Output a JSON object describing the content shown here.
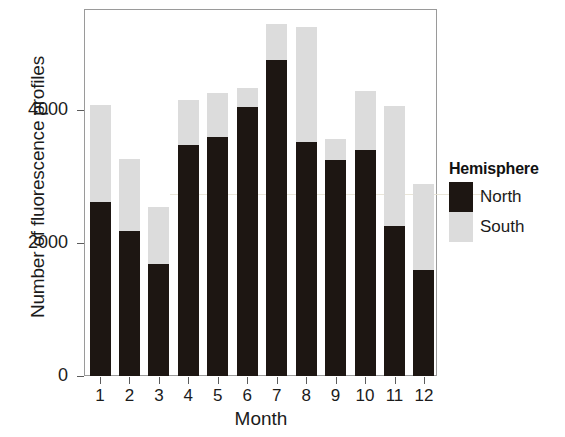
{
  "chart_data": {
    "type": "bar",
    "subtype": "stacked-bar",
    "title": "",
    "xlabel": "Month",
    "ylabel": "Number of fluorescence profiles",
    "categories": [
      "1",
      "2",
      "3",
      "4",
      "5",
      "6",
      "7",
      "8",
      "9",
      "10",
      "11",
      "12"
    ],
    "series": [
      {
        "name": "North",
        "color": "#1d1612",
        "values": [
          2620,
          2180,
          1680,
          3480,
          3600,
          4050,
          4760,
          3520,
          3250,
          3400,
          2250,
          1590
        ]
      },
      {
        "name": "South",
        "color": "#dcdcdc",
        "values": [
          1460,
          1080,
          860,
          670,
          650,
          280,
          530,
          1730,
          310,
          880,
          1810,
          1300
        ]
      }
    ],
    "totals": [
      4080,
      3260,
      2540,
      4150,
      4250,
      4330,
      5290,
      5250,
      3560,
      4280,
      4060,
      2890
    ],
    "ylim": [
      0,
      5520
    ],
    "yticks": [
      0,
      2000,
      4000
    ],
    "ytick_labels": [
      "0",
      "2000",
      "4000"
    ],
    "xtick_labels": [
      "1",
      "2",
      "3",
      "4",
      "5",
      "6",
      "7",
      "8",
      "9",
      "10",
      "11",
      "12"
    ],
    "grid": false,
    "legend": {
      "title": "Hemisphere",
      "position": "right",
      "entries": [
        {
          "label": "North",
          "color": "#1d1612"
        },
        {
          "label": "South",
          "color": "#dcdcdc"
        }
      ]
    }
  },
  "axes": {
    "y_title": "Number of fluorescence profiles",
    "x_title": "Month"
  },
  "legend": {
    "title": "Hemisphere",
    "north_label": "North",
    "south_label": "South"
  }
}
